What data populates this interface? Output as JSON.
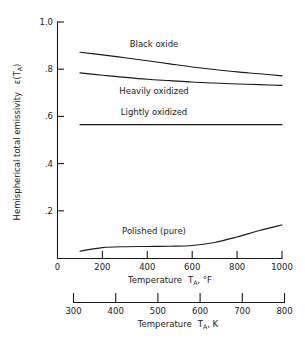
{
  "chart_data": {
    "type": "line",
    "title": "",
    "xlabel": "Temperature  T_A,  °F",
    "ylabel": "Hemispherical total emissivity  ε(T_A)",
    "xlim": [
      0,
      1000
    ],
    "ylim": [
      0,
      1.0
    ],
    "grid": false,
    "legend": "inline-labels",
    "x_ticks": [
      0,
      200,
      400,
      600,
      800,
      1000
    ],
    "x_tick_labels": [
      "0",
      "200",
      "400",
      "600",
      "800",
      "1000"
    ],
    "y_ticks": [
      0,
      0.2,
      0.4,
      0.6,
      0.8,
      1.0
    ],
    "y_tick_labels": [
      "0",
      ".2",
      ".4",
      ".6",
      ".8",
      "1.0"
    ],
    "secondary_xlabel": "Temperature  T_A,   K",
    "secondary_x_ticks": [
      300,
      400,
      500,
      600,
      700,
      800
    ],
    "secondary_x_tick_labels": [
      "300",
      "400",
      "500",
      "600",
      "700",
      "800"
    ],
    "secondary_xlim": [
      300,
      800
    ],
    "series": [
      {
        "name": "Black oxide",
        "x": [
          100,
          200,
          300,
          400,
          500,
          600,
          700,
          800,
          900,
          1000
        ],
        "values": [
          0.872,
          0.861,
          0.849,
          0.836,
          0.823,
          0.81,
          0.799,
          0.789,
          0.781,
          0.772
        ]
      },
      {
        "name": "Heavily oxidized",
        "x": [
          100,
          200,
          300,
          400,
          500,
          600,
          700,
          800,
          900,
          1000
        ],
        "values": [
          0.785,
          0.775,
          0.766,
          0.758,
          0.752,
          0.746,
          0.742,
          0.738,
          0.735,
          0.732
        ]
      },
      {
        "name": "Lightly oxidized",
        "x": [
          100,
          200,
          300,
          400,
          500,
          600,
          700,
          800,
          900,
          1000
        ],
        "values": [
          0.566,
          0.566,
          0.566,
          0.566,
          0.566,
          0.566,
          0.566,
          0.566,
          0.566,
          0.566
        ]
      },
      {
        "name": "Polished (pure)",
        "x": [
          100,
          200,
          300,
          400,
          500,
          600,
          700,
          800,
          900,
          1000
        ],
        "values": [
          0.031,
          0.046,
          0.05,
          0.051,
          0.052,
          0.055,
          0.068,
          0.091,
          0.118,
          0.142
        ]
      }
    ],
    "annotations": [
      {
        "text": "Black oxide",
        "x": 430,
        "y": 0.895
      },
      {
        "text": "Heavily oxidized",
        "x": 430,
        "y": 0.695
      },
      {
        "text": "Lightly oxidized",
        "x": 430,
        "y": 0.605
      },
      {
        "text": "Polished (pure)",
        "x": 430,
        "y": 0.105
      }
    ]
  },
  "axes": {
    "y_label_main": "Hemispherical total emissivity",
    "y_label_symbol": "ε(T",
    "y_label_subscript": "A",
    "y_label_close": ")",
    "x_label_word": "Temperature",
    "x_label_symbol": "T",
    "x_label_subscript": "A",
    "x_label_unit_f": ",  °F",
    "x_label_unit_k": ",   K"
  }
}
